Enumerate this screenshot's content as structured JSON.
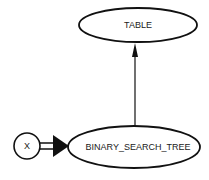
{
  "diagram": {
    "nodes": [
      {
        "id": "table",
        "label": "TABLE",
        "shape": "ellipse"
      },
      {
        "id": "bst",
        "label": "BINARY_SEARCH_TREE",
        "shape": "ellipse"
      },
      {
        "id": "x",
        "label": "X",
        "shape": "circle"
      }
    ],
    "edges": [
      {
        "from": "bst",
        "to": "table",
        "style": "single-arrow"
      },
      {
        "from": "x",
        "to": "bst",
        "style": "double-line-arrow"
      }
    ],
    "colors": {
      "stroke": "#111111",
      "background": "#ffffff"
    }
  }
}
